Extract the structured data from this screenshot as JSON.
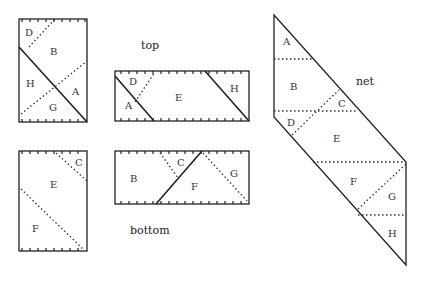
{
  "diagram": {
    "captions": {
      "top": "top",
      "bottom": "bottom",
      "net": "net"
    },
    "panels": {
      "top_left": {
        "labels": [
          "D",
          "B",
          "H",
          "A",
          "G"
        ]
      },
      "top_strip": {
        "labels": [
          "D",
          "A",
          "E",
          "H"
        ]
      },
      "bottom_left": {
        "labels": [
          "C",
          "E",
          "F"
        ]
      },
      "bottom_strip": {
        "labels": [
          "B",
          "C",
          "F",
          "G"
        ]
      },
      "net": {
        "labels": [
          "A",
          "B",
          "C",
          "D",
          "E",
          "F",
          "G",
          "H"
        ]
      }
    },
    "legend_styles": {
      "solid_line": "cut / edge",
      "dotted_line": "fold",
      "tick_edge": "hinged edge"
    }
  }
}
